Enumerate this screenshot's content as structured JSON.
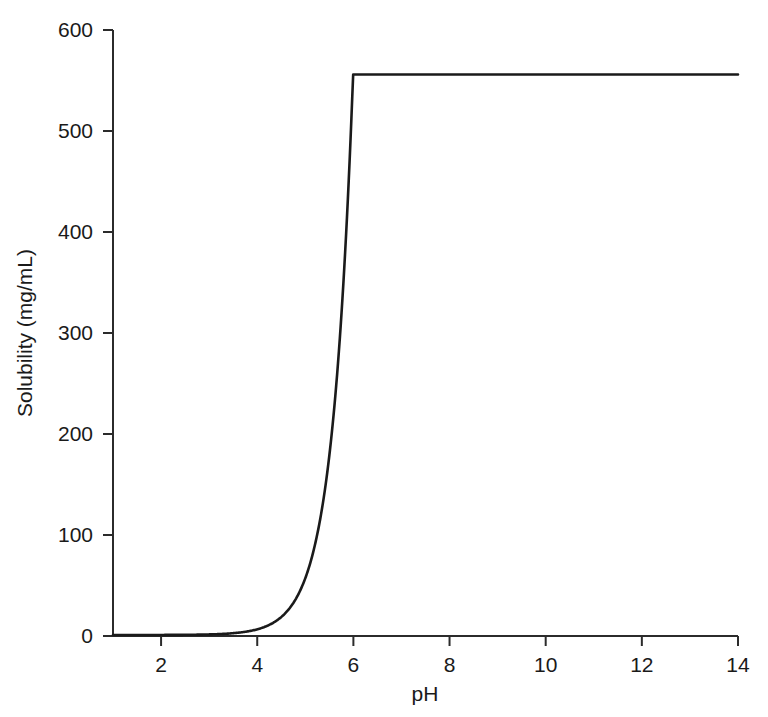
{
  "chart_data": {
    "type": "line",
    "title": "",
    "subtitle": "",
    "xlabel": "pH",
    "ylabel": "Solubility (mg/mL)",
    "xlim": [
      1,
      14
    ],
    "ylim": [
      0,
      600
    ],
    "xticks": [
      2,
      4,
      6,
      8,
      10,
      12,
      14
    ],
    "xticklabels": [
      "2",
      "4",
      "6",
      "8",
      "10",
      "12",
      "14"
    ],
    "yticks": [
      0,
      100,
      200,
      300,
      400,
      500,
      600
    ],
    "yticklabels": [
      "0",
      "100",
      "200",
      "300",
      "400",
      "500",
      "600"
    ],
    "grid": false,
    "legend": false,
    "legend_position": "none",
    "line_color": "#1a1a1a",
    "line_width_px": 2.6,
    "spines": [
      "left",
      "bottom"
    ],
    "tick_direction": "out",
    "annotations": [],
    "model": {
      "equation": "S = S0 * (1 + 10^(pH - pKa)), capped at S_max",
      "intrinsic_solubility_S0": 1.0,
      "pKa": 3.25,
      "S_max": 556,
      "plateau_start_pH": 6.72,
      "plateau_value": 556
    },
    "series": [
      {
        "name": "pH-solubility profile",
        "color": "#1a1a1a",
        "x": [
          1.0,
          1.5,
          2.0,
          2.5,
          3.0,
          3.5,
          4.0,
          4.25,
          4.5,
          4.75,
          5.0,
          5.25,
          5.5,
          5.75,
          6.0,
          6.1,
          6.2,
          6.3,
          6.4,
          6.5,
          6.6,
          6.72,
          7.0,
          7.5,
          8.0,
          9.0,
          10.0,
          11.0,
          12.0,
          13.0,
          14.0
        ],
        "y": [
          1.01,
          1.02,
          1.06,
          1.18,
          1.56,
          2.78,
          6.62,
          10.2,
          16.8,
          28.2,
          57.2,
          100.1,
          178.6,
          317.2,
          563.0,
          556.0,
          556.0,
          556.0,
          556.0,
          556.0,
          556.0,
          556.0,
          556.0,
          556.0,
          556.0,
          556.0,
          556.0,
          556.0,
          556.0,
          556.0,
          556.0
        ]
      }
    ],
    "points_note": "Curve rises exponentially from ~1 mg/mL at low pH and plateaus at 556 mg/mL from pH 6.72 to 14"
  },
  "axes": {
    "x_axis_label": "pH",
    "y_axis_label": "Solubility (mg/mL)"
  }
}
